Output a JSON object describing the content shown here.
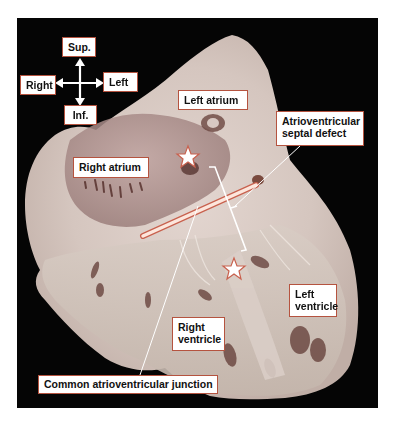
{
  "figure": {
    "colors": {
      "background": "#050505",
      "tissue_light": "#e8dcd6",
      "tissue_mid": "#c9b8b1",
      "tissue_dark": "#6a3a34",
      "label_border": "#b5533f",
      "bar_fill": "#fde6dc",
      "star_fill": "#ffffff",
      "star_stroke": "#c8614e"
    },
    "orientation": {
      "sup": "Sup.",
      "inf": "Inf.",
      "right": "Right",
      "left": "Left"
    },
    "labels": {
      "left_atrium": "Left atrium",
      "right_atrium": "Right atrium",
      "avsd_line1": "Atrioventricular",
      "avsd_line2": "septal defect",
      "left_ventricle_line1": "Left",
      "left_ventricle_line2": "ventricle",
      "right_ventricle_line1": "Right",
      "right_ventricle_line2": "ventricle",
      "common_av_junction": "Common atrioventricular junction"
    },
    "markers": [
      {
        "type": "star",
        "location": "atrial component of defect"
      },
      {
        "type": "star",
        "location": "ventricular component of defect"
      }
    ]
  }
}
